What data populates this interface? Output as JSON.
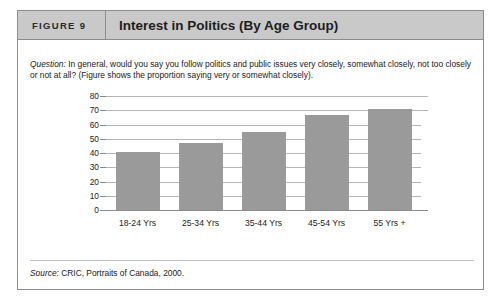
{
  "figure": {
    "number_label": "FIGURE 9",
    "title": "Interest in Politics (By Age Group)"
  },
  "question": {
    "label": "Question:",
    "text": " In general, would you say you follow politics and public issues very closely, somewhat closely, not too closely or not at all? (Figure shows the proportion saying very or somewhat closely)."
  },
  "source": {
    "label": "Source:",
    "text": " CRIC, Portraits of Canada, 2000."
  },
  "colors": {
    "header_band": "#c9c9c9",
    "bar_fill": "#9a9a9a",
    "gridline": "#b5b5b5",
    "frame_border": "#8c8c8c"
  },
  "chart_data": {
    "type": "bar",
    "title": "Interest in Politics (By Age Group)",
    "categories": [
      "18-24 Yrs",
      "25-34 Yrs",
      "35-44 Yrs",
      "45-54 Yrs",
      "55 Yrs +"
    ],
    "values": [
      41,
      47,
      55,
      67,
      71
    ],
    "xlabel": "",
    "ylabel": "",
    "ylim": [
      0,
      80
    ],
    "yticks": [
      0,
      10,
      20,
      30,
      40,
      50,
      60,
      70,
      80
    ],
    "ytick_labels": [
      "0",
      "10",
      "20",
      "30",
      "40",
      "50",
      "60",
      "70",
      "80"
    ],
    "grid": true,
    "legend": false,
    "series": [
      {
        "name": "Proportion saying very or somewhat closely",
        "values": [
          41,
          47,
          55,
          67,
          71
        ]
      }
    ]
  }
}
